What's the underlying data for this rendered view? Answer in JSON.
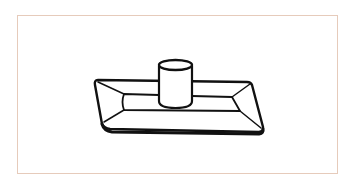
{
  "figure": {
    "frame_color": "#e6cbbb",
    "line_color": "#111111",
    "background": "#ffffff",
    "parts": [
      {
        "name": "tray",
        "shape": "beveled rectangular tray"
      },
      {
        "name": "cylinder",
        "shape": "upright cylinder"
      }
    ]
  }
}
